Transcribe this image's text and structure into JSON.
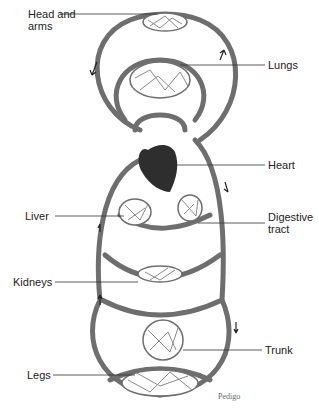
{
  "diagram": {
    "labels": {
      "head_arms": "Head and\narms",
      "head_arms_line1": "Head and",
      "head_arms_line2": "arms",
      "lungs": "Lungs",
      "heart": "Heart",
      "liver": "Liver",
      "digestive_line1": "Digestive",
      "digestive_line2": "tract",
      "kidneys": "Kidneys",
      "trunk": "Trunk",
      "legs": "Legs"
    },
    "credit": "Pedigo",
    "colors": {
      "vessel": "#6e6e6e",
      "heart": "#2e2e2e",
      "text": "#222222",
      "leader": "#333333"
    }
  }
}
